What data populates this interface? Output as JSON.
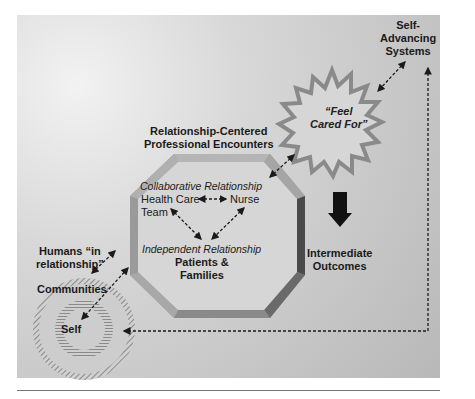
{
  "diagram": {
    "nodes": {
      "self_advancing": {
        "line1": "Self-",
        "line2": "Advancing",
        "line3": "Systems"
      },
      "feel_cared_for": {
        "line1": "“Feel",
        "line2": "Cared For”"
      },
      "encounters_title": {
        "line1": "Relationship-Centered",
        "line2": "Professional Encounters"
      },
      "collaborative": "Collaborative Relationship",
      "health_care_team": {
        "line1": "Health Care",
        "line2": "Team"
      },
      "nurse": "Nurse",
      "independent": "Independent Relationship",
      "patients_families": {
        "line1": "Patients &",
        "line2": "Families"
      },
      "humans_in_relationship": {
        "line1": "Humans “in",
        "line2": "relationship”"
      },
      "communities": "Communities",
      "self": "Self",
      "intermediate_outcomes": {
        "line1": "Intermediate",
        "line2": "Outcomes"
      }
    },
    "colors": {
      "octagon_face": "#9a9a9a",
      "octagon_dark": "#4a4a4a",
      "starburst_edge": "#8a8a8a",
      "arrow": "#1a1a1a"
    }
  }
}
